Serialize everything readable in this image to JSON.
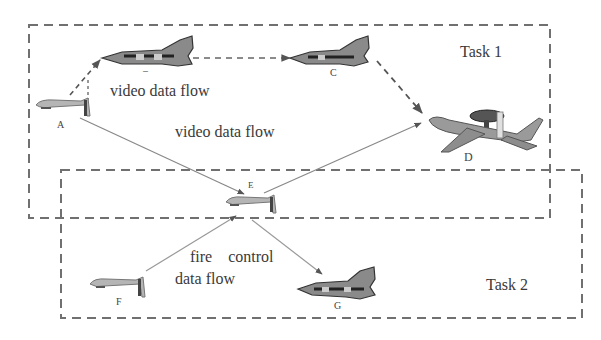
{
  "diagram": {
    "tasks": [
      {
        "id": "task1",
        "label": "Task 1"
      },
      {
        "id": "task2",
        "label": "Task 2"
      }
    ],
    "nodes": [
      {
        "id": "A",
        "label": "A",
        "type": "uav"
      },
      {
        "id": "B",
        "label": "–",
        "type": "fighter"
      },
      {
        "id": "C",
        "label": "C",
        "type": "fighter"
      },
      {
        "id": "D",
        "label": "D",
        "type": "awacs"
      },
      {
        "id": "E",
        "label": "E",
        "type": "uav"
      },
      {
        "id": "F",
        "label": "F",
        "type": "uav"
      },
      {
        "id": "G",
        "label": "G",
        "type": "fighter"
      }
    ],
    "edges": [
      {
        "from": "A",
        "to": "B",
        "style": "dashed"
      },
      {
        "from": "B",
        "to": "C",
        "style": "dashed"
      },
      {
        "from": "C",
        "to": "D",
        "style": "dashed"
      },
      {
        "from": "A",
        "to": "E",
        "style": "solid"
      },
      {
        "from": "E",
        "to": "D",
        "style": "solid"
      },
      {
        "from": "F",
        "to": "E",
        "style": "solid"
      },
      {
        "from": "E",
        "to": "G",
        "style": "solid"
      }
    ],
    "flow_labels": {
      "video_flow_1": "video data flow",
      "video_flow_2": "video data flow",
      "fire_control_line1": "fire    control",
      "fire_control_line2": "data flow"
    },
    "colors": {
      "box_stroke": "#707070",
      "line": "#8a8a8a",
      "aircraft_dark": "#4a4a4a",
      "aircraft_light": "#a8a8a8"
    }
  }
}
